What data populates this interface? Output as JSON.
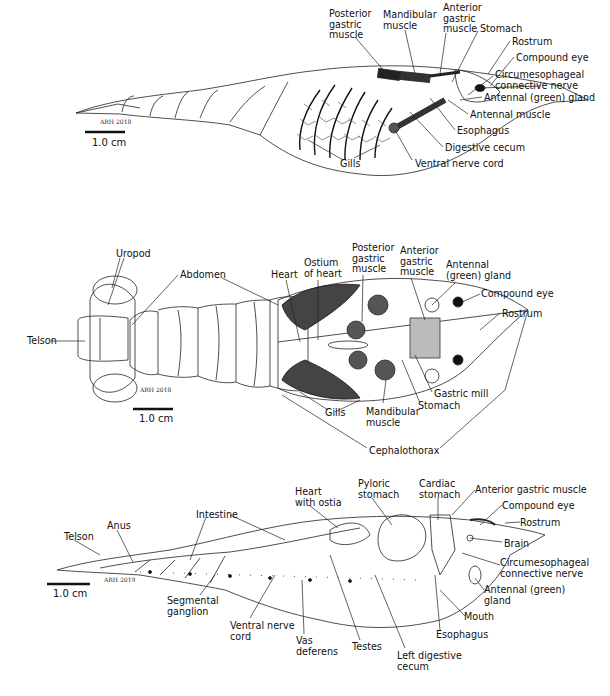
{
  "figures": [
    {
      "id": "lateral-external",
      "scale_bar": "1.0 cm",
      "signature": "ARH 2018",
      "labels": [
        {
          "text": "Posterior\ngastric\nmuscle",
          "x": 329,
          "y": 9
        },
        {
          "text": "Mandibular\nmuscle",
          "x": 383,
          "y": 10
        },
        {
          "text": "Anterior\ngastric\nmuscle",
          "x": 443,
          "y": 3
        },
        {
          "text": "Stomach",
          "x": 480,
          "y": 24
        },
        {
          "text": "Rostrum",
          "x": 512,
          "y": 37
        },
        {
          "text": "Compound eye",
          "x": 516,
          "y": 53
        },
        {
          "text": "Circumesophageal\nconnective nerve",
          "x": 495,
          "y": 70
        },
        {
          "text": "Antennal (green) gland",
          "x": 484,
          "y": 93
        },
        {
          "text": "Antennal muscle",
          "x": 470,
          "y": 110
        },
        {
          "text": "Esophagus",
          "x": 457,
          "y": 126
        },
        {
          "text": "Digestive cecum",
          "x": 445,
          "y": 143
        },
        {
          "text": "Gills",
          "x": 340,
          "y": 159
        },
        {
          "text": "Ventral nerve cord",
          "x": 415,
          "y": 159
        }
      ]
    },
    {
      "id": "dorsal",
      "scale_bar": "1.0 cm",
      "signature": "ARH 2018",
      "labels": [
        {
          "text": "Uropod",
          "x": 116,
          "y": 249
        },
        {
          "text": "Abdomen",
          "x": 180,
          "y": 270
        },
        {
          "text": "Telson",
          "x": 27,
          "y": 338
        },
        {
          "text": "Heart",
          "x": 271,
          "y": 270
        },
        {
          "text": "Ostium\nof heart",
          "x": 304,
          "y": 258
        },
        {
          "text": "Posterior\ngastric\nmuscle",
          "x": 352,
          "y": 243
        },
        {
          "text": "Anterior\ngastric\nmuscle",
          "x": 400,
          "y": 246
        },
        {
          "text": "Antennal\n(green) gland",
          "x": 446,
          "y": 260
        },
        {
          "text": "Compound eye",
          "x": 481,
          "y": 289
        },
        {
          "text": "Rostrum",
          "x": 502,
          "y": 309
        },
        {
          "text": "Gastric mill",
          "x": 434,
          "y": 389
        },
        {
          "text": "Stomach",
          "x": 418,
          "y": 401
        },
        {
          "text": "Gills",
          "x": 325,
          "y": 408
        },
        {
          "text": "Mandibular\nmuscle",
          "x": 366,
          "y": 407
        },
        {
          "text": "Cephalothorax",
          "x": 369,
          "y": 448
        }
      ]
    },
    {
      "id": "lateral-internal",
      "scale_bar": "1.0 cm",
      "signature": "ARH 2019",
      "labels": [
        {
          "text": "Heart\nwith ostia",
          "x": 295,
          "y": 487
        },
        {
          "text": "Pyloric\nstomach",
          "x": 358,
          "y": 479
        },
        {
          "text": "Cardiac\nstomach",
          "x": 419,
          "y": 479
        },
        {
          "text": "Anterior gastric muscle",
          "x": 475,
          "y": 485
        },
        {
          "text": "Compound eye",
          "x": 502,
          "y": 501
        },
        {
          "text": "Rostrum",
          "x": 520,
          "y": 518
        },
        {
          "text": "Brain",
          "x": 504,
          "y": 539
        },
        {
          "text": "Circumesophageal\nconnective nerve",
          "x": 500,
          "y": 558
        },
        {
          "text": "Antennal (green)\ngland",
          "x": 484,
          "y": 585
        },
        {
          "text": "Mouth",
          "x": 464,
          "y": 612
        },
        {
          "text": "Esophagus",
          "x": 436,
          "y": 630
        },
        {
          "text": "Left digestive\ncecum",
          "x": 397,
          "y": 651
        },
        {
          "text": "Testes",
          "x": 352,
          "y": 642
        },
        {
          "text": "Vas\ndeferens",
          "x": 296,
          "y": 636
        },
        {
          "text": "Ventral nerve\ncord",
          "x": 230,
          "y": 621
        },
        {
          "text": "Segmental\nganglion",
          "x": 167,
          "y": 596
        },
        {
          "text": "Intestine",
          "x": 196,
          "y": 510
        },
        {
          "text": "Anus",
          "x": 107,
          "y": 521
        },
        {
          "text": "Telson",
          "x": 64,
          "y": 532
        }
      ]
    }
  ],
  "scale_bars": [
    {
      "x": 85,
      "y": 131,
      "label_x": 92,
      "label_y": 137
    },
    {
      "x": 133,
      "y": 408,
      "label_x": 139,
      "label_y": 413
    },
    {
      "x": 47,
      "y": 583,
      "label_x": 53,
      "label_y": 588
    }
  ],
  "signatures": [
    {
      "text": "ARH 2018",
      "x": 100,
      "y": 118
    },
    {
      "text": "ARH 2018",
      "x": 140,
      "y": 386
    },
    {
      "text": "ARH 2019",
      "x": 104,
      "y": 578
    }
  ]
}
